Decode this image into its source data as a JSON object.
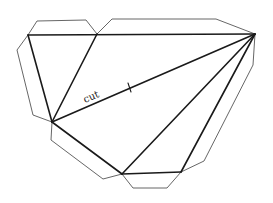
{
  "diagram": {
    "type": "polyhedron-net",
    "label": "cut",
    "colors": {
      "fold_line": "#1a1a1a",
      "tab_outline": "#555555",
      "background": "#ffffff"
    },
    "vertices": {
      "A": [
        28,
        35
      ],
      "B": [
        97,
        34
      ],
      "C": [
        255,
        34
      ],
      "D": [
        52,
        122
      ],
      "E": [
        122,
        174
      ],
      "F": [
        181,
        172
      ]
    },
    "fold_lines": [
      "A-C",
      "A-D",
      "B-D",
      "C-D",
      "C-E",
      "C-F",
      "D-E",
      "E-F"
    ],
    "tabs": [
      "top-left",
      "top-right",
      "left",
      "lower-left",
      "bottom",
      "right"
    ],
    "cut_edge": "C-D"
  }
}
